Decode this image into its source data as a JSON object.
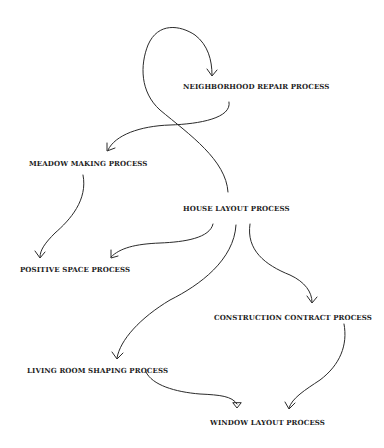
{
  "diagram": {
    "type": "process-dependency-graph",
    "nodes": [
      {
        "id": "neighborhood",
        "label": "NEIGHBORHOOD REPAIR PROCESS",
        "x": 183,
        "y": 82
      },
      {
        "id": "meadow",
        "label": "MEADOW MAKING PROCESS",
        "x": 29,
        "y": 159
      },
      {
        "id": "house",
        "label": "HOUSE LAYOUT PROCESS",
        "x": 183,
        "y": 204
      },
      {
        "id": "positive",
        "label": "POSITIVE SPACE PROCESS",
        "x": 20,
        "y": 265
      },
      {
        "id": "construction",
        "label": "CONSTRUCTION CONTRACT PROCESS",
        "x": 214,
        "y": 313
      },
      {
        "id": "living",
        "label": "LIVING ROOM SHAPING PROCESS",
        "x": 27,
        "y": 366
      },
      {
        "id": "window",
        "label": "WINDOW LAYOUT PROCESS",
        "x": 210,
        "y": 418
      }
    ],
    "edges": [
      {
        "from": "house",
        "to": "neighborhood"
      },
      {
        "from": "neighborhood",
        "to": "meadow"
      },
      {
        "from": "meadow",
        "to": "positive"
      },
      {
        "from": "house",
        "to": "positive"
      },
      {
        "from": "house",
        "to": "living"
      },
      {
        "from": "house",
        "to": "construction"
      },
      {
        "from": "living",
        "to": "window"
      },
      {
        "from": "construction",
        "to": "window"
      }
    ]
  }
}
